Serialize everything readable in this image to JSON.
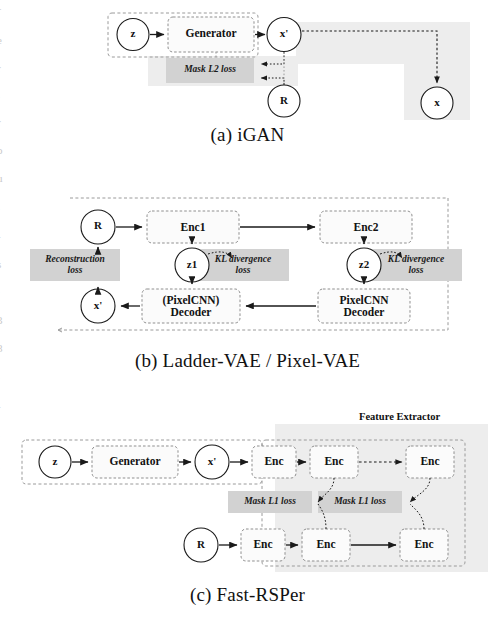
{
  "figure": {
    "panels": [
      {
        "id": "a",
        "caption": "(a) iGAN",
        "nodes": [
          {
            "name": "z",
            "label": "z",
            "shape": "circle"
          },
          {
            "name": "generator",
            "label": "Generator",
            "shape": "box"
          },
          {
            "name": "x-prime",
            "label": "x'",
            "shape": "circle"
          },
          {
            "name": "r",
            "label": "R",
            "shape": "circle"
          },
          {
            "name": "x",
            "label": "x",
            "shape": "circle"
          }
        ],
        "losses": [
          {
            "name": "mask-l2-loss",
            "label": "Mask L2 loss"
          }
        ]
      },
      {
        "id": "b",
        "caption": "(b) Ladder-VAE / Pixel-VAE",
        "nodes": [
          {
            "name": "r",
            "label": "R",
            "shape": "circle"
          },
          {
            "name": "enc1",
            "label": "Enc1",
            "shape": "box"
          },
          {
            "name": "enc2",
            "label": "Enc2",
            "shape": "box"
          },
          {
            "name": "z1",
            "label": "z1",
            "shape": "circle"
          },
          {
            "name": "z2",
            "label": "z2",
            "shape": "circle"
          },
          {
            "name": "pixelcnn-decoder-optional",
            "label": "(PixelCNN)\nDecoder",
            "shape": "box"
          },
          {
            "name": "pixelcnn-decoder",
            "label": "PixelCNN\nDecoder",
            "shape": "box"
          },
          {
            "name": "x-prime",
            "label": "x'",
            "shape": "circle"
          }
        ],
        "losses": [
          {
            "name": "reconstruction-loss",
            "label": "Reconstruction\nloss"
          },
          {
            "name": "kl-divergence-loss-1",
            "label": "KL divergence\nloss"
          },
          {
            "name": "kl-divergence-loss-2",
            "label": "KL divergence\nloss"
          }
        ]
      },
      {
        "id": "c",
        "caption": "(c) Fast-RSPer",
        "group_label": "Feature Extractor",
        "nodes": [
          {
            "name": "z",
            "label": "z",
            "shape": "circle"
          },
          {
            "name": "generator",
            "label": "Generator",
            "shape": "box"
          },
          {
            "name": "x-prime",
            "label": "x'",
            "shape": "circle"
          },
          {
            "name": "enc-top-1",
            "label": "Enc",
            "shape": "box"
          },
          {
            "name": "enc-top-2",
            "label": "Enc",
            "shape": "box"
          },
          {
            "name": "enc-top-3",
            "label": "Enc",
            "shape": "box"
          },
          {
            "name": "r",
            "label": "R",
            "shape": "circle"
          },
          {
            "name": "enc-bottom-1",
            "label": "Enc",
            "shape": "box"
          },
          {
            "name": "enc-bottom-2",
            "label": "Enc",
            "shape": "box"
          },
          {
            "name": "enc-bottom-3",
            "label": "Enc",
            "shape": "box"
          }
        ],
        "losses": [
          {
            "name": "mask-l1-loss-1",
            "label": "Mask L1 loss"
          },
          {
            "name": "mask-l1-loss-2",
            "label": "Mask L1 loss"
          }
        ]
      }
    ],
    "colors": {
      "stroke": "#1a1a1a",
      "loss_fill": "#d4d4d4",
      "panel_shade": "#ebebeb",
      "dashed_group": "#888888",
      "background": "#ffffff"
    }
  }
}
